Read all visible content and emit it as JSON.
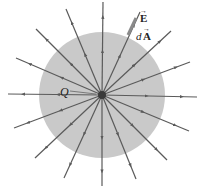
{
  "diagram": {
    "type": "gaussian-sphere-point-charge",
    "colors": {
      "sphere_fill": "#c9c9c9",
      "field_line": "#5a5a5a",
      "charge": "#3a3a3a",
      "background": "#ffffff"
    },
    "center": [
      102,
      95
    ],
    "sphere_radius": 63,
    "field_line_endpoints": [
      [
        103,
        2
      ],
      [
        140,
        12
      ],
      [
        171,
        31
      ],
      [
        190,
        62
      ],
      [
        197,
        97
      ],
      [
        189,
        131
      ],
      [
        167,
        160
      ],
      [
        136,
        179
      ],
      [
        102,
        186
      ],
      [
        64,
        178
      ],
      [
        35,
        158
      ],
      [
        14,
        128
      ],
      [
        8,
        94
      ],
      [
        16,
        58
      ],
      [
        36,
        29
      ],
      [
        66,
        9
      ]
    ],
    "labels": {
      "charge": "Q",
      "field_vector": "E",
      "area_vector_prefix": "d",
      "area_vector": "A"
    }
  }
}
